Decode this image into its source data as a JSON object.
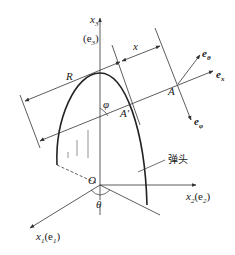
{
  "diagram": {
    "type": "projectile nose coordinate geometry",
    "colors": {
      "line": "#333333",
      "curve": "#222222",
      "background": "#ffffff"
    },
    "axes": {
      "x3": {
        "label": "x",
        "sub": "3",
        "basis": "(e",
        "basis_sub": "3",
        "basis_close": ")"
      },
      "x2": {
        "label": "x",
        "sub": "2",
        "basis": "(e",
        "basis_sub": "2",
        "basis_close": ")"
      },
      "x1": {
        "label": "x",
        "sub": "1",
        "basis": "(e",
        "basis_sub": "1",
        "basis_close": ")"
      }
    },
    "origin": "O",
    "angles": {
      "theta": "θ",
      "phi": "φ"
    },
    "dimensions": {
      "R": "R",
      "x": "x"
    },
    "points": {
      "A": "A",
      "A_prime": "A′"
    },
    "unit_vectors": {
      "e_theta": {
        "base": "e",
        "sub": "θ"
      },
      "e_x": {
        "base": "e",
        "sub": "x"
      },
      "e_phi": {
        "base": "e",
        "sub": "φ"
      }
    },
    "callout": "弹头"
  }
}
